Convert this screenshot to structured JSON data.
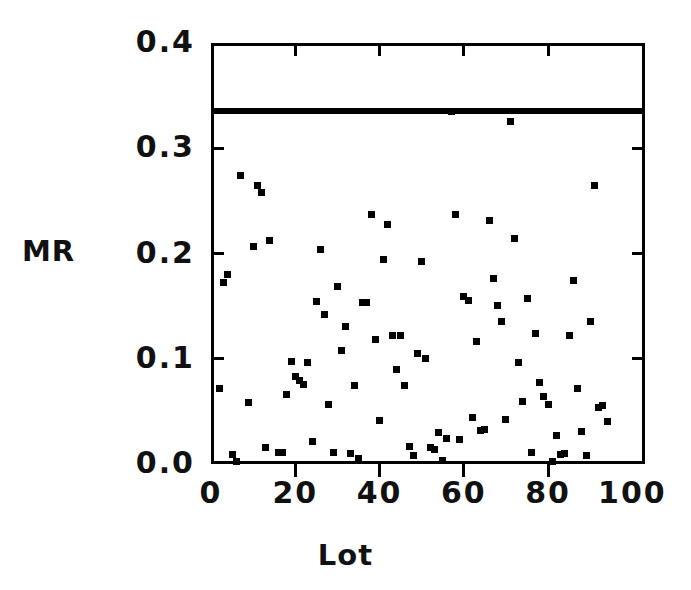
{
  "chart_data": {
    "type": "scatter",
    "title": "",
    "xlabel": "Lot",
    "ylabel": "MR",
    "xlim": [
      0,
      103
    ],
    "ylim": [
      0.0,
      0.4
    ],
    "grid": false,
    "legend": null,
    "xticks": [
      0,
      20,
      40,
      60,
      80,
      100
    ],
    "xtick_labels": [
      "0",
      "20",
      "40",
      "60",
      "80",
      "100"
    ],
    "yticks": [
      0.0,
      0.1,
      0.2,
      0.3,
      0.4
    ],
    "ytick_labels": [
      "0.0",
      "0.1",
      "0.2",
      "0.3",
      "0.4"
    ],
    "annotations": [
      {
        "name": "upper-control-limit",
        "type": "hline",
        "y": 0.335,
        "style": "thick-solid-black"
      }
    ],
    "marker": "filled-square",
    "marker_color": "#000000",
    "points": [
      {
        "x": 2,
        "y": 0.072
      },
      {
        "x": 3,
        "y": 0.172
      },
      {
        "x": 4,
        "y": 0.18
      },
      {
        "x": 5,
        "y": 0.009
      },
      {
        "x": 6,
        "y": 0.002
      },
      {
        "x": 7,
        "y": 0.274
      },
      {
        "x": 9,
        "y": 0.058
      },
      {
        "x": 10,
        "y": 0.207
      },
      {
        "x": 11,
        "y": 0.265
      },
      {
        "x": 12,
        "y": 0.258
      },
      {
        "x": 13,
        "y": 0.016
      },
      {
        "x": 14,
        "y": 0.212
      },
      {
        "x": 16,
        "y": 0.011
      },
      {
        "x": 17,
        "y": 0.011
      },
      {
        "x": 18,
        "y": 0.066
      },
      {
        "x": 19,
        "y": 0.097
      },
      {
        "x": 20,
        "y": 0.083
      },
      {
        "x": 21,
        "y": 0.079
      },
      {
        "x": 22,
        "y": 0.076
      },
      {
        "x": 23,
        "y": 0.096
      },
      {
        "x": 24,
        "y": 0.021
      },
      {
        "x": 25,
        "y": 0.154
      },
      {
        "x": 26,
        "y": 0.204
      },
      {
        "x": 27,
        "y": 0.142
      },
      {
        "x": 28,
        "y": 0.057
      },
      {
        "x": 29,
        "y": 0.011
      },
      {
        "x": 30,
        "y": 0.169
      },
      {
        "x": 31,
        "y": 0.108
      },
      {
        "x": 32,
        "y": 0.131
      },
      {
        "x": 33,
        "y": 0.01
      },
      {
        "x": 34,
        "y": 0.075
      },
      {
        "x": 35,
        "y": 0.005
      },
      {
        "x": 36,
        "y": 0.153
      },
      {
        "x": 37,
        "y": 0.153
      },
      {
        "x": 38,
        "y": 0.237
      },
      {
        "x": 39,
        "y": 0.118
      },
      {
        "x": 40,
        "y": 0.041
      },
      {
        "x": 41,
        "y": 0.194
      },
      {
        "x": 42,
        "y": 0.228
      },
      {
        "x": 43,
        "y": 0.122
      },
      {
        "x": 44,
        "y": 0.09
      },
      {
        "x": 45,
        "y": 0.122
      },
      {
        "x": 46,
        "y": 0.075
      },
      {
        "x": 47,
        "y": 0.017
      },
      {
        "x": 48,
        "y": 0.008
      },
      {
        "x": 49,
        "y": 0.105
      },
      {
        "x": 50,
        "y": 0.192
      },
      {
        "x": 51,
        "y": 0.1
      },
      {
        "x": 52,
        "y": 0.016
      },
      {
        "x": 53,
        "y": 0.014
      },
      {
        "x": 54,
        "y": 0.03
      },
      {
        "x": 55,
        "y": 0.003
      },
      {
        "x": 56,
        "y": 0.024
      },
      {
        "x": 57,
        "y": 0.335
      },
      {
        "x": 58,
        "y": 0.237
      },
      {
        "x": 59,
        "y": 0.023
      },
      {
        "x": 60,
        "y": 0.159
      },
      {
        "x": 61,
        "y": 0.155
      },
      {
        "x": 62,
        "y": 0.044
      },
      {
        "x": 63,
        "y": 0.116
      },
      {
        "x": 64,
        "y": 0.032
      },
      {
        "x": 65,
        "y": 0.033
      },
      {
        "x": 66,
        "y": 0.231
      },
      {
        "x": 67,
        "y": 0.176
      },
      {
        "x": 68,
        "y": 0.151
      },
      {
        "x": 69,
        "y": 0.135
      },
      {
        "x": 70,
        "y": 0.042
      },
      {
        "x": 71,
        "y": 0.325
      },
      {
        "x": 72,
        "y": 0.214
      },
      {
        "x": 73,
        "y": 0.096
      },
      {
        "x": 74,
        "y": 0.059
      },
      {
        "x": 75,
        "y": 0.157
      },
      {
        "x": 76,
        "y": 0.011
      },
      {
        "x": 77,
        "y": 0.124
      },
      {
        "x": 78,
        "y": 0.077
      },
      {
        "x": 79,
        "y": 0.064
      },
      {
        "x": 80,
        "y": 0.057
      },
      {
        "x": 81,
        "y": 0.002
      },
      {
        "x": 82,
        "y": 0.027
      },
      {
        "x": 83,
        "y": 0.009
      },
      {
        "x": 84,
        "y": 0.01
      },
      {
        "x": 85,
        "y": 0.122
      },
      {
        "x": 86,
        "y": 0.174
      },
      {
        "x": 87,
        "y": 0.072
      },
      {
        "x": 88,
        "y": 0.031
      },
      {
        "x": 89,
        "y": 0.008
      },
      {
        "x": 90,
        "y": 0.135
      },
      {
        "x": 91,
        "y": 0.265
      },
      {
        "x": 92,
        "y": 0.054
      },
      {
        "x": 93,
        "y": 0.056
      },
      {
        "x": 94,
        "y": 0.04
      }
    ]
  },
  "axes": {
    "y_title": "MR",
    "x_title": "Lot"
  }
}
